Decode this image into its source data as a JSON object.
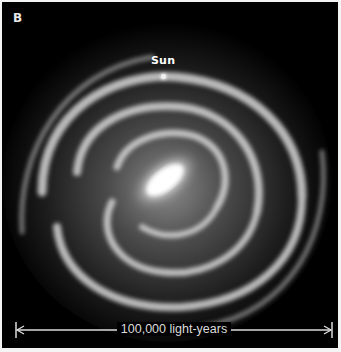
{
  "figure": {
    "panel_label": "B",
    "annotations": {
      "sun_label": "Sun"
    },
    "scale_bar": {
      "label": "100,000 light-years"
    },
    "colors": {
      "background": "#000000",
      "frame": "#f4f4f4",
      "text": "#ffffff"
    }
  }
}
